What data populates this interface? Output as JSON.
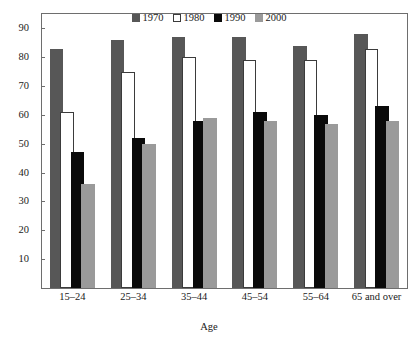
{
  "chart_data": {
    "type": "bar",
    "title": "",
    "xlabel": "Age",
    "ylabel": "",
    "categories": [
      "15–24",
      "25–34",
      "35–44",
      "45–54",
      "55–64",
      "65 and over"
    ],
    "series": [
      {
        "name": "1970",
        "color": "#575757",
        "values": [
          83,
          86,
          87,
          87,
          84,
          88
        ]
      },
      {
        "name": "1980",
        "color": "#ffffff",
        "values": [
          61,
          75,
          80,
          79,
          79,
          83
        ]
      },
      {
        "name": "1990",
        "color": "#0a0a0a",
        "values": [
          47,
          52,
          58,
          61,
          60,
          63
        ]
      },
      {
        "name": "2000",
        "color": "#9a9a9a",
        "values": [
          36,
          50,
          59,
          58,
          57,
          58
        ]
      }
    ],
    "ylim": [
      0,
      95
    ],
    "yticks": [
      10,
      20,
      30,
      40,
      50,
      60,
      70,
      80,
      90
    ],
    "ytick_labels": [
      "10",
      "20",
      "30",
      "40",
      "50",
      "60",
      "70",
      "80",
      "90"
    ],
    "grid": false,
    "legend_position": "top-center",
    "legend": [
      "1970",
      "1980",
      "1990",
      "2000"
    ]
  },
  "axes": {
    "x_title": "Age"
  }
}
